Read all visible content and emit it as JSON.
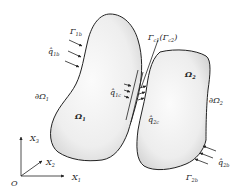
{
  "diagram": {
    "colors": {
      "outline": "#222222",
      "fill_light": "#f6f6f6",
      "fill_dark": "#d9d9d9",
      "text": "#222222"
    },
    "body1": {
      "domain": "Ω",
      "domain_sub": "1",
      "boundary": "∂Ω",
      "boundary_sub": "1",
      "flux_boundary": "Γ",
      "flux_boundary_sub": "1b",
      "flux": "q̂",
      "flux_sub": "1b",
      "contact_flux": "q̂",
      "contact_flux_sub": "1c"
    },
    "body2": {
      "domain": "Ω",
      "domain_sub": "2",
      "boundary": "∂Ω",
      "boundary_sub": "2",
      "flux_boundary": "Γ",
      "flux_boundary_sub": "2b",
      "flux": "q̂",
      "flux_sub": "2b",
      "contact_flux": "q̂",
      "contact_flux_sub": "2c"
    },
    "contact": {
      "label": "Γ",
      "label_sub": "c1",
      "paren_label": "(Γ",
      "paren_sub": "c2",
      "paren_close": ")"
    },
    "axes": {
      "origin": "O",
      "x1": "X",
      "x1_sub": "1",
      "x2": "X",
      "x2_sub": "2",
      "x3": "X",
      "x3_sub": "3"
    }
  }
}
